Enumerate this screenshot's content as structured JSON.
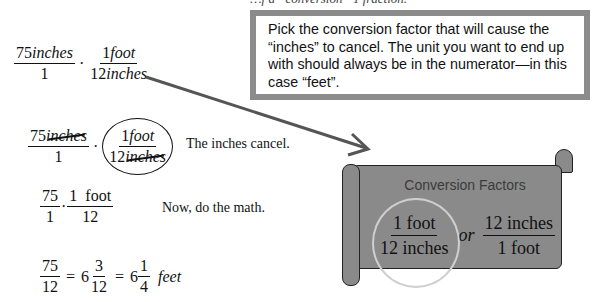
{
  "top_text_cut": "…f a “conversion” 1 fraction.",
  "callout": {
    "text": "Pick the conversion factor that will cause the “inches” to cancel.  The unit you want to end up with should always be in the numerator—in this case “feet”."
  },
  "steps": [
    {
      "fractions": [
        {
          "num_value": "75",
          "num_unit": "inches",
          "den": "1"
        },
        {
          "num_value": "1",
          "num_unit": "foot",
          "den_value": "12",
          "den_unit": "inches"
        }
      ],
      "operator": "·"
    },
    {
      "fractions": [
        {
          "num_value": "75",
          "num_unit": "inches",
          "den": "1"
        },
        {
          "num_value": "1",
          "num_unit": "foot",
          "den_value": "12",
          "den_unit": "inches"
        }
      ],
      "operator": "·",
      "note": "The inches cancel."
    },
    {
      "fractions": [
        {
          "num": "75",
          "den": "1"
        },
        {
          "num": "1  foot",
          "den": "12"
        }
      ],
      "operator": "·",
      "note": "Now, do the math."
    },
    {
      "fraction": {
        "num": "75",
        "den": "12"
      },
      "equals": "=",
      "mixed1": {
        "whole": "6",
        "num": "3",
        "den": "12"
      },
      "mixed2": {
        "whole": "6",
        "num": "1",
        "den": "4"
      },
      "unit": "feet"
    }
  ],
  "scroll": {
    "title": "Conversion Factors",
    "factor1": {
      "num": "1 foot",
      "den": "12 inches"
    },
    "or": "or",
    "factor2": {
      "num": "12 inches",
      "den": "1 foot"
    }
  },
  "colors": {
    "callout_border": "#8b8b8b",
    "scroll_fill": "#8a8a8a",
    "arrow": "#555555",
    "highlight_circle": "#cfcfcf"
  }
}
